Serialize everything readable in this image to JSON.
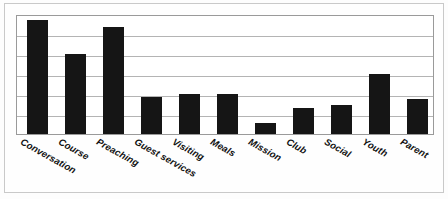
{
  "chart_data": {
    "type": "bar",
    "title": "",
    "subtitle": "",
    "xlabel": "",
    "ylabel": "",
    "ylim": [
      0,
      100
    ],
    "grid": true,
    "gridline_count": 5,
    "legend": "none",
    "bar_color": "#151515",
    "plot_border_color": "#9a9a9a",
    "gridline_color": "#b4b4b4",
    "categories": [
      "Conversation",
      "Course",
      "Preaching",
      "Guest services",
      "Visiting",
      "Meals",
      "Mission",
      "Club",
      "Social",
      "Youth",
      "Parent"
    ],
    "values": [
      95,
      67,
      89,
      31,
      33,
      33,
      9,
      22,
      24,
      50,
      29
    ],
    "series": [
      {
        "name": "",
        "values": [
          95,
          67,
          89,
          31,
          33,
          33,
          9,
          22,
          24,
          50,
          29
        ]
      }
    ],
    "tick_labels": {
      "x": [
        "Conversation",
        "Course",
        "Preaching",
        "Guest services",
        "Visiting",
        "Meals",
        "Mission",
        "Club",
        "Social",
        "Youth",
        "Parent"
      ],
      "y": []
    },
    "annotations": []
  }
}
